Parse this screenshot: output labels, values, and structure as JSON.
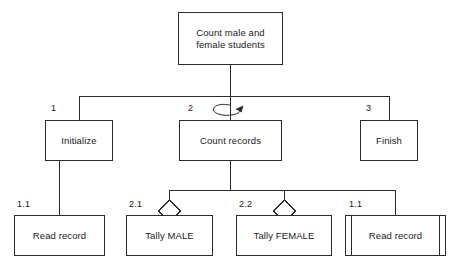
{
  "diagram": {
    "type": "structure-chart",
    "stroke_color": "#2b2b2b",
    "text_color": "#1a1a1a",
    "background_color": "#ffffff"
  },
  "nodes": [
    {
      "id": "root",
      "label": "Count male and\nfemale students",
      "seq": "",
      "level": 0,
      "shape": "rect",
      "x": 178,
      "y": 12,
      "w": 105,
      "h": 53
    },
    {
      "id": "initialize",
      "label": "Initialize",
      "seq": "1",
      "seq_x": 51,
      "seq_y": 103,
      "level": 1,
      "shape": "rect",
      "x": 45,
      "y": 120,
      "w": 68,
      "h": 41
    },
    {
      "id": "count-records",
      "label": "Count records",
      "seq": "2",
      "seq_x": 188,
      "seq_y": 103,
      "level": 1,
      "shape": "rect",
      "loop": true,
      "x": 179,
      "y": 120,
      "w": 103,
      "h": 41
    },
    {
      "id": "finish",
      "label": "Finish",
      "seq": "3",
      "seq_x": 366,
      "seq_y": 103,
      "level": 1,
      "shape": "rect",
      "x": 360,
      "y": 120,
      "w": 58,
      "h": 41
    },
    {
      "id": "read-record-1",
      "label": "Read record",
      "seq": "1.1",
      "seq_x": 17,
      "seq_y": 199,
      "level": 2,
      "shape": "rect",
      "x": 14,
      "y": 215,
      "w": 91,
      "h": 41
    },
    {
      "id": "tally-male",
      "label": "Tally MALE",
      "seq": "2.1",
      "seq_x": 129,
      "seq_y": 199,
      "level": 2,
      "shape": "rect",
      "diamond": true,
      "x": 126,
      "y": 215,
      "w": 87,
      "h": 41
    },
    {
      "id": "tally-female",
      "label": "Tally FEMALE",
      "seq": "2.2",
      "seq_x": 239,
      "seq_y": 199,
      "level": 2,
      "shape": "rect",
      "diamond": true,
      "x": 236,
      "y": 215,
      "w": 96,
      "h": 41
    },
    {
      "id": "read-record-2",
      "label": "Read record",
      "seq": "1.1",
      "seq_x": 349,
      "seq_y": 199,
      "level": 2,
      "shape": "library-module",
      "x": 345,
      "y": 215,
      "w": 101,
      "h": 41
    }
  ],
  "edges": [
    {
      "from": "root",
      "to": "initialize"
    },
    {
      "from": "root",
      "to": "count-records"
    },
    {
      "from": "root",
      "to": "finish"
    },
    {
      "from": "initialize",
      "to": "read-record-1"
    },
    {
      "from": "count-records",
      "to": "tally-male"
    },
    {
      "from": "count-records",
      "to": "tally-female"
    },
    {
      "from": "count-records",
      "to": "read-record-2"
    }
  ],
  "symbols": {
    "loop_arrow": "loop-arrow-icon",
    "decision_diamond": "decision-diamond-icon",
    "library_module": "library-module-bars"
  }
}
